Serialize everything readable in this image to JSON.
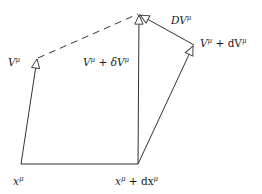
{
  "diagram": {
    "type": "parallel-transport-vector-diagram",
    "colors": {
      "stroke": "#333333",
      "background": "#ffffff"
    },
    "points": {
      "x_mu": [
        21,
        164
      ],
      "x_plus_dx": [
        138,
        164
      ],
      "V_tip": [
        37,
        58
      ],
      "V_plus_deltaV_tip": [
        139,
        14
      ],
      "V_plus_dV_tip": [
        194,
        45
      ]
    },
    "labels": {
      "x_mu": {
        "base": "x",
        "sup": "μ"
      },
      "x_plus_dx": {
        "base": "x",
        "sup": "μ",
        "mid": " + dx",
        "sup2": "μ"
      },
      "V": {
        "base": "V",
        "sup": "μ"
      },
      "V_plus_deltaV": {
        "base": "V",
        "sup": "μ",
        "mid": " + δV",
        "sup2": "μ"
      },
      "V_plus_dV": {
        "base": "V",
        "sup": "μ",
        "mid": " + dV",
        "sup2": "μ"
      },
      "DV": {
        "base": "DV",
        "sup": "μ"
      }
    },
    "edges": [
      {
        "from": "x_mu",
        "to": "x_plus_dx",
        "style": "solid",
        "arrow": false,
        "name": "displacement-line"
      },
      {
        "from": "x_mu",
        "to": "V_tip",
        "style": "solid",
        "arrow": true,
        "name": "vector-V"
      },
      {
        "from": "x_plus_dx",
        "to": "V_plus_deltaV_tip",
        "style": "solid",
        "arrow": true,
        "name": "vector-V-plus-deltaV"
      },
      {
        "from": "x_plus_dx",
        "to": "V_plus_dV_tip",
        "style": "solid",
        "arrow": true,
        "name": "vector-V-plus-dV"
      },
      {
        "from": "V_plus_dV_tip",
        "to": "V_plus_deltaV_tip",
        "style": "solid",
        "arrow": true,
        "name": "vector-DV"
      },
      {
        "from": "V_tip",
        "to": "V_plus_deltaV_tip",
        "style": "dashed",
        "arrow": false,
        "name": "parallel-transport-dashed-line"
      }
    ]
  }
}
